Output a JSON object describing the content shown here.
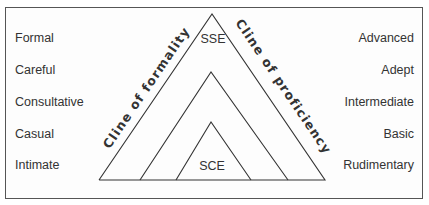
{
  "diagram": {
    "left_scale": {
      "items": [
        "Formal",
        "Careful",
        "Consultative",
        "Casual",
        "Intimate"
      ]
    },
    "right_scale": {
      "items": [
        "Advanced",
        "Adept",
        "Intermediate",
        "Basic",
        "Rudimentary"
      ]
    },
    "axis_labels": {
      "left": "Cline of formality",
      "right": "Cline of proficiency"
    },
    "triangle_labels": {
      "top": "SSE",
      "bottom": "SCE"
    },
    "colors": {
      "line": "#333333",
      "text": "#333333",
      "frame": "#555555"
    }
  }
}
